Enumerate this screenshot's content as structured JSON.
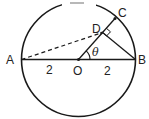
{
  "diagram": {
    "type": "geometry",
    "points": {
      "A": {
        "label": "A"
      },
      "B": {
        "label": "B"
      },
      "O": {
        "label": "O"
      },
      "C": {
        "label": "C"
      },
      "D": {
        "label": "D"
      }
    },
    "segment_labels": {
      "AO": "2",
      "OB": "2"
    },
    "angle_label": "θ",
    "colors": {
      "stroke": "#1a1a1a",
      "background": "#ffffff"
    }
  }
}
